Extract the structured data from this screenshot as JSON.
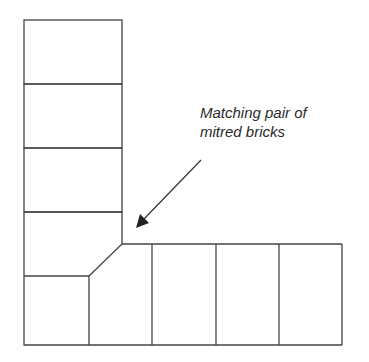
{
  "diagram": {
    "annotation": {
      "line1": "Matching pair of",
      "line2": "mitred bricks"
    },
    "colors": {
      "stroke": "#444444",
      "background": "#ffffff",
      "text": "#2a2a2a"
    },
    "vertical_column_bricks": 5,
    "horizontal_row_bricks": 4
  }
}
